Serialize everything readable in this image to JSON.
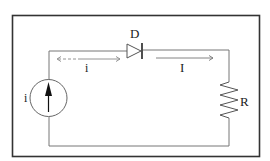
{
  "diagram": {
    "type": "circuit",
    "components": [
      {
        "id": "source",
        "kind": "current-source",
        "label": "i"
      },
      {
        "id": "diode",
        "kind": "diode",
        "label": "D"
      },
      {
        "id": "resistor",
        "kind": "resistor",
        "label": "R"
      }
    ],
    "currents": [
      {
        "label": "i",
        "style": "dashed-bidirectional",
        "location": "left of diode"
      },
      {
        "label": "I",
        "style": "solid-arrow-right",
        "location": "right of diode"
      }
    ],
    "colors": {
      "frame": "#333333",
      "wire": "#666666",
      "text": "#222222"
    }
  }
}
